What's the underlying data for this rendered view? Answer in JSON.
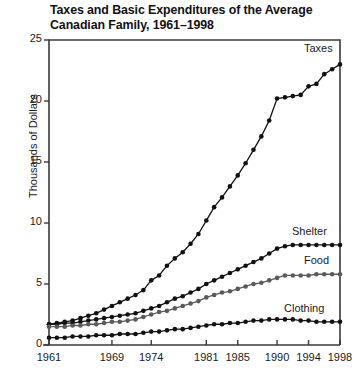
{
  "chart_data": {
    "type": "line",
    "title": "Taxes and Basic Expenditures of the Average Canadian Family, 1961–1998",
    "title_line1": "Taxes and Basic Expenditures of the Average",
    "title_line2": "Canadian Family, 1961–1998",
    "xlabel": "",
    "ylabel": "Thousands of Dollars",
    "xlim": [
      1961,
      1998
    ],
    "ylim": [
      0,
      25
    ],
    "yticks": [
      0,
      5,
      10,
      15,
      20,
      25
    ],
    "ytick_labels": [
      "0",
      "5",
      "10",
      "15",
      "20",
      "25"
    ],
    "xticks": [
      1961,
      1969,
      1974,
      1981,
      1985,
      1990,
      1994,
      1998
    ],
    "xtick_labels": [
      "1961",
      "1969",
      "1974",
      "1981",
      "1985",
      "1990",
      "1994",
      "1998"
    ],
    "grid": false,
    "legend_position": "inline-right-of-series",
    "markers": "filled-circle",
    "x": [
      1961,
      1962,
      1963,
      1964,
      1965,
      1966,
      1967,
      1968,
      1969,
      1970,
      1971,
      1972,
      1973,
      1974,
      1975,
      1976,
      1977,
      1978,
      1979,
      1980,
      1981,
      1982,
      1983,
      1984,
      1985,
      1986,
      1987,
      1988,
      1989,
      1990,
      1991,
      1992,
      1993,
      1994,
      1995,
      1996,
      1997,
      1998
    ],
    "series": [
      {
        "name": "Taxes",
        "color": "#111111",
        "values": [
          1.7,
          1.8,
          1.9,
          2.0,
          2.2,
          2.4,
          2.6,
          2.9,
          3.2,
          3.5,
          3.8,
          4.1,
          4.5,
          5.3,
          5.7,
          6.5,
          7.1,
          7.6,
          8.3,
          9.1,
          10.2,
          11.3,
          12.1,
          13.0,
          13.9,
          14.9,
          16.0,
          17.1,
          18.4,
          20.2,
          20.3,
          20.4,
          20.5,
          21.2,
          21.4,
          22.2,
          22.6,
          23.0
        ]
      },
      {
        "name": "Shelter",
        "color": "#111111",
        "values": [
          1.7,
          1.7,
          1.8,
          1.8,
          1.9,
          2.0,
          2.1,
          2.2,
          2.3,
          2.4,
          2.5,
          2.6,
          2.8,
          3.0,
          3.2,
          3.5,
          3.8,
          4.0,
          4.3,
          4.6,
          5.0,
          5.3,
          5.6,
          5.9,
          6.2,
          6.5,
          6.8,
          7.1,
          7.5,
          7.9,
          8.1,
          8.2,
          8.2,
          8.2,
          8.2,
          8.2,
          8.2,
          8.2
        ]
      },
      {
        "name": "Food",
        "color": "#5a5a5a",
        "values": [
          1.5,
          1.5,
          1.5,
          1.6,
          1.6,
          1.7,
          1.7,
          1.8,
          1.9,
          1.9,
          2.0,
          2.1,
          2.3,
          2.5,
          2.7,
          2.8,
          3.0,
          3.2,
          3.4,
          3.6,
          3.9,
          4.1,
          4.3,
          4.4,
          4.6,
          4.8,
          5.0,
          5.1,
          5.3,
          5.5,
          5.7,
          5.7,
          5.7,
          5.7,
          5.8,
          5.8,
          5.8,
          5.8
        ]
      },
      {
        "name": "Clothing",
        "color": "#111111",
        "values": [
          0.6,
          0.6,
          0.6,
          0.7,
          0.7,
          0.7,
          0.8,
          0.8,
          0.8,
          0.9,
          0.9,
          0.9,
          1.0,
          1.1,
          1.1,
          1.2,
          1.3,
          1.3,
          1.4,
          1.5,
          1.6,
          1.7,
          1.7,
          1.8,
          1.8,
          1.9,
          2.0,
          2.0,
          2.1,
          2.1,
          2.1,
          2.1,
          2.0,
          2.0,
          1.9,
          1.9,
          1.9,
          1.9
        ]
      }
    ],
    "annotations": [
      {
        "text": "Taxes",
        "series": "Taxes"
      },
      {
        "text": "Shelter",
        "series": "Shelter"
      },
      {
        "text": "Food",
        "series": "Food"
      },
      {
        "text": "Clothing",
        "series": "Clothing"
      }
    ]
  }
}
